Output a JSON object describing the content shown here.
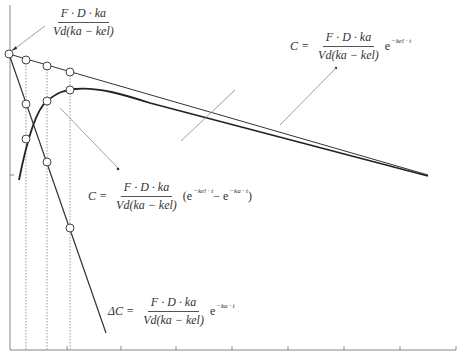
{
  "diagram": {
    "type": "pharmacokinetic-curve",
    "axes": {
      "x_ticks_px": [
        67,
        121,
        176,
        232,
        288,
        344,
        400,
        456
      ],
      "y_tick_px": [
        175
      ]
    },
    "equations": {
      "intercept": {
        "numerator": "F · D · ka",
        "denominator": "Vd(ka − kel)"
      },
      "elimination": {
        "lhs": "C =",
        "numerator": "F · D · ka",
        "denominator": "Vd(ka − kel)",
        "exp": "e",
        "exp_power": "−kel · t"
      },
      "concentration": {
        "lhs": "C =",
        "numerator": "F · D · ka",
        "denominator": "Vd(ka − kel)",
        "tail": "(e",
        "power1": "−kel · t",
        "mid": " − e",
        "power2": "−ka · t",
        "close": ")"
      },
      "residual": {
        "lhs": "ΔC =",
        "numerator": "F · D · ka",
        "denominator": "Vd(ka − kel)",
        "exp": "e",
        "exp_power": "−ka · t"
      }
    },
    "colors": {
      "curve": "#222222",
      "axis": "#888888",
      "guide": "#999999",
      "marker_fill": "#ffffff"
    }
  }
}
